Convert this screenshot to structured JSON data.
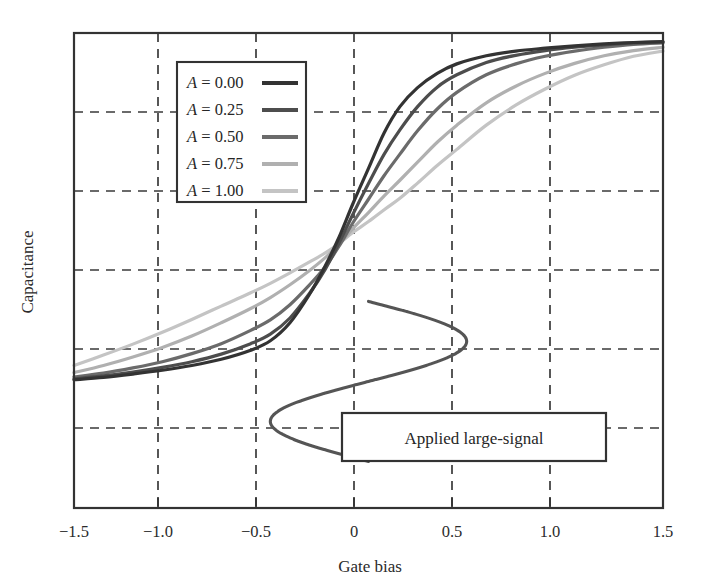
{
  "chart_data": {
    "type": "line",
    "title": "",
    "xlabel": "Gate bias",
    "ylabel": "Capacitance",
    "xlim": [
      -1.5,
      1.5
    ],
    "ylim": [
      0,
      1
    ],
    "xticks": [
      -1.5,
      -1.0,
      -0.5,
      0,
      0.5,
      1.0,
      1.5
    ],
    "xticklabels": [
      "−1.5",
      "−1.0",
      "−0.5",
      "0",
      "0.5",
      "1.0",
      "1.5"
    ],
    "yticks": [],
    "yticklabels": [],
    "grid": true,
    "grid_style": "dashed",
    "legend_position": "upper-left-inside",
    "series": [
      {
        "name": "A = 0.00",
        "label_symbol": "A",
        "label_value": "0.00",
        "color": "#333333",
        "x": [
          -1.5,
          -1.35,
          -1.2,
          -1.05,
          -0.9,
          -0.75,
          -0.6,
          -0.5,
          -0.4,
          -0.3,
          -0.22,
          -0.15,
          -0.08,
          0.0,
          0.08,
          0.16,
          0.25,
          0.35,
          0.45,
          0.6,
          0.75,
          0.9,
          1.05,
          1.2,
          1.35,
          1.5
        ],
        "y": [
          0.27,
          0.275,
          0.282,
          0.29,
          0.3,
          0.313,
          0.332,
          0.352,
          0.39,
          0.45,
          0.51,
          0.57,
          0.64,
          0.715,
          0.79,
          0.845,
          0.885,
          0.915,
          0.935,
          0.952,
          0.962,
          0.968,
          0.973,
          0.977,
          0.98,
          0.982
        ]
      },
      {
        "name": "A = 0.25",
        "label_symbol": "A",
        "label_value": "0.25",
        "color": "#4d4d4d",
        "x": [
          -1.5,
          -1.35,
          -1.2,
          -1.05,
          -0.9,
          -0.75,
          -0.6,
          -0.5,
          -0.4,
          -0.3,
          -0.22,
          -0.15,
          -0.08,
          0.0,
          0.08,
          0.16,
          0.25,
          0.35,
          0.45,
          0.6,
          0.75,
          0.9,
          1.05,
          1.2,
          1.35,
          1.5
        ],
        "y": [
          0.272,
          0.278,
          0.286,
          0.296,
          0.308,
          0.324,
          0.346,
          0.366,
          0.4,
          0.452,
          0.503,
          0.558,
          0.618,
          0.683,
          0.745,
          0.796,
          0.845,
          0.886,
          0.912,
          0.938,
          0.953,
          0.963,
          0.97,
          0.975,
          0.979,
          0.981
        ]
      },
      {
        "name": "A = 0.50",
        "label_symbol": "A",
        "label_value": "0.50",
        "color": "#6b6b6b",
        "x": [
          -1.5,
          -1.35,
          -1.2,
          -1.05,
          -0.9,
          -0.75,
          -0.6,
          -0.5,
          -0.4,
          -0.3,
          -0.22,
          -0.15,
          -0.08,
          0.0,
          0.08,
          0.16,
          0.25,
          0.35,
          0.45,
          0.6,
          0.75,
          0.9,
          1.05,
          1.2,
          1.35,
          1.5
        ],
        "y": [
          0.276,
          0.284,
          0.295,
          0.308,
          0.325,
          0.346,
          0.374,
          0.396,
          0.428,
          0.47,
          0.508,
          0.551,
          0.6,
          0.65,
          0.7,
          0.745,
          0.794,
          0.84,
          0.875,
          0.912,
          0.935,
          0.951,
          0.962,
          0.97,
          0.976,
          0.979
        ]
      },
      {
        "name": "A = 0.75",
        "label_symbol": "A",
        "label_value": "0.75",
        "color": "#b0b0b0",
        "x": [
          -1.5,
          -1.35,
          -1.2,
          -1.05,
          -0.9,
          -0.75,
          -0.6,
          -0.5,
          -0.4,
          -0.3,
          -0.22,
          -0.15,
          -0.08,
          0.0,
          0.08,
          0.16,
          0.25,
          0.35,
          0.45,
          0.6,
          0.75,
          0.9,
          1.05,
          1.2,
          1.35,
          1.5
        ],
        "y": [
          0.285,
          0.3,
          0.318,
          0.338,
          0.362,
          0.39,
          0.42,
          0.443,
          0.47,
          0.5,
          0.527,
          0.555,
          0.588,
          0.622,
          0.657,
          0.69,
          0.728,
          0.77,
          0.806,
          0.853,
          0.888,
          0.915,
          0.936,
          0.952,
          0.963,
          0.97
        ]
      },
      {
        "name": "A = 1.00",
        "label_symbol": "A",
        "label_value": "1.00",
        "color": "#c4c4c4",
        "x": [
          -1.5,
          -1.35,
          -1.2,
          -1.05,
          -0.9,
          -0.75,
          -0.6,
          -0.5,
          -0.4,
          -0.3,
          -0.22,
          -0.15,
          -0.08,
          0.0,
          0.08,
          0.16,
          0.25,
          0.35,
          0.45,
          0.6,
          0.75,
          0.9,
          1.05,
          1.2,
          1.35,
          1.5
        ],
        "y": [
          0.3,
          0.322,
          0.345,
          0.37,
          0.397,
          0.425,
          0.453,
          0.473,
          0.495,
          0.518,
          0.537,
          0.557,
          0.58,
          0.603,
          0.628,
          0.652,
          0.684,
          0.721,
          0.755,
          0.806,
          0.848,
          0.882,
          0.911,
          0.933,
          0.951,
          0.962
        ]
      }
    ],
    "annotations": [
      {
        "name": "applied-large-signal",
        "text": "Applied large-signal",
        "type": "boxed-label",
        "box_x_range": [
          -0.06,
          0.92
        ],
        "box_y_range": [
          0.1,
          0.24
        ]
      },
      {
        "name": "large-signal-sinusoid",
        "type": "vertical-sinusoid",
        "description": "Sine wave drawn vertically, amplitude spanning gate bias -0.5 to 0.5, one full cycle",
        "x_amplitude": 0.5,
        "x_center": 0.0,
        "y_top": 0.435,
        "y_bottom": 0.098,
        "color": "#555555"
      }
    ]
  },
  "legend": {
    "entries": [
      {
        "symbol": "A",
        "equals": "=",
        "value": "0.00",
        "color": "#333333"
      },
      {
        "symbol": "A",
        "equals": "=",
        "value": "0.25",
        "color": "#4d4d4d"
      },
      {
        "symbol": "A",
        "equals": "=",
        "value": "0.50",
        "color": "#6b6b6b"
      },
      {
        "symbol": "A",
        "equals": "=",
        "value": "0.75",
        "color": "#b0b0b0"
      },
      {
        "symbol": "A",
        "equals": "=",
        "value": "1.00",
        "color": "#c4c4c4"
      }
    ]
  },
  "axes": {
    "x_label": "Gate bias",
    "y_label": "Capacitance",
    "tick_0": "−1.5",
    "tick_1": "−1.0",
    "tick_2": "−0.5",
    "tick_3": "0",
    "tick_4": "0.5",
    "tick_5": "1.0",
    "tick_6": "1.5"
  },
  "annotation": {
    "applied_large_signal": "Applied large-signal"
  },
  "colors": {
    "frame": "#333333",
    "grid": "#3a3a3a",
    "background": "#ffffff",
    "text": "#2b2b2b"
  }
}
